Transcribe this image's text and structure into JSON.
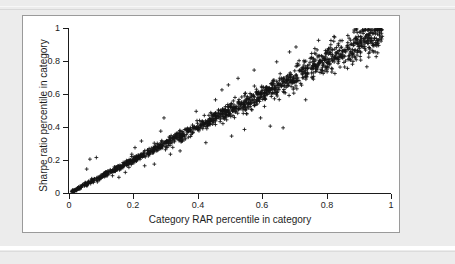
{
  "figure": {
    "panel_background": "#ffffff",
    "page_background": "#ececec",
    "marker": "plus",
    "marker_color": "#141414"
  },
  "chart_data": {
    "type": "scatter",
    "title": "",
    "xlabel": "Category RAR percentile in category",
    "ylabel": "Sharpe ratio percentile in category",
    "xlim": [
      0,
      1
    ],
    "ylim": [
      0,
      1
    ],
    "xticks": [
      0,
      0.2,
      0.4,
      0.6,
      0.8,
      1
    ],
    "yticks": [
      0,
      0.2,
      0.4,
      0.6,
      0.8,
      1
    ],
    "xtick_labels": [
      "0",
      "0.2",
      "0.4",
      "0.6",
      "0.8",
      "1"
    ],
    "ytick_labels": [
      "0",
      "0.2",
      "0.4",
      "0.6",
      "0.8",
      "1"
    ],
    "grid": false,
    "legend": null,
    "relationship": "near-perfect positive linear, y approximately equals x",
    "n_points": 1400,
    "noise_model": {
      "description": "Gaussian scatter about the y=x diagonal whose spread grows with x",
      "sigma_at_x0": 0.004,
      "sigma_at_x1": 0.055
    },
    "outliers": [
      {
        "x": 0.055,
        "y": 0.145
      },
      {
        "x": 0.065,
        "y": 0.205
      },
      {
        "x": 0.085,
        "y": 0.215
      },
      {
        "x": 0.135,
        "y": 0.105
      },
      {
        "x": 0.155,
        "y": 0.095
      },
      {
        "x": 0.175,
        "y": 0.125
      },
      {
        "x": 0.195,
        "y": 0.235
      },
      {
        "x": 0.205,
        "y": 0.275
      },
      {
        "x": 0.225,
        "y": 0.315
      },
      {
        "x": 0.235,
        "y": 0.165
      },
      {
        "x": 0.265,
        "y": 0.175
      },
      {
        "x": 0.285,
        "y": 0.375
      },
      {
        "x": 0.295,
        "y": 0.455
      },
      {
        "x": 0.315,
        "y": 0.235
      },
      {
        "x": 0.345,
        "y": 0.255
      },
      {
        "x": 0.395,
        "y": 0.495
      },
      {
        "x": 0.425,
        "y": 0.305
      },
      {
        "x": 0.455,
        "y": 0.565
      },
      {
        "x": 0.475,
        "y": 0.625
      },
      {
        "x": 0.495,
        "y": 0.655
      },
      {
        "x": 0.505,
        "y": 0.345
      },
      {
        "x": 0.525,
        "y": 0.695
      },
      {
        "x": 0.545,
        "y": 0.385
      },
      {
        "x": 0.575,
        "y": 0.745
      },
      {
        "x": 0.595,
        "y": 0.455
      },
      {
        "x": 0.625,
        "y": 0.405
      },
      {
        "x": 0.645,
        "y": 0.795
      },
      {
        "x": 0.665,
        "y": 0.395
      },
      {
        "x": 0.685,
        "y": 0.855
      },
      {
        "x": 0.705,
        "y": 0.885
      },
      {
        "x": 0.735,
        "y": 0.565
      },
      {
        "x": 0.775,
        "y": 0.925
      },
      {
        "x": 0.825,
        "y": 0.945
      },
      {
        "x": 0.865,
        "y": 0.755
      },
      {
        "x": 0.885,
        "y": 0.975
      },
      {
        "x": 0.925,
        "y": 0.765
      },
      {
        "x": 0.945,
        "y": 0.855
      }
    ]
  }
}
